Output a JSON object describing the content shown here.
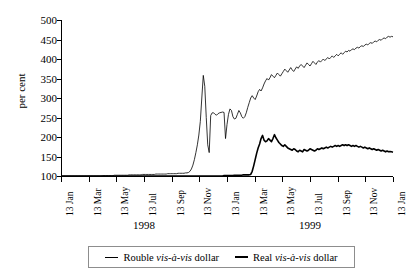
{
  "chart_data": {
    "type": "line",
    "title": "",
    "xlabel": "",
    "ylabel": "per cent",
    "ylim": [
      100,
      500
    ],
    "ytick_labels": [
      "500",
      "450",
      "400",
      "350",
      "300",
      "250",
      "200",
      "150",
      "100"
    ],
    "ytick_values": [
      500,
      450,
      400,
      350,
      300,
      250,
      200,
      150,
      100
    ],
    "grid": false,
    "legend_position": "bottom",
    "xtick_labels": [
      "13 Jan",
      "13 Mar",
      "13 May",
      "13 Jul",
      "13 Sep",
      "13 Nov",
      "13 Jan",
      "13 Mar",
      "13 May",
      "13 Jul",
      "13 Sep",
      "13 Nov",
      "13 Jan"
    ],
    "year_labels": [
      "1998",
      "1999"
    ],
    "series": [
      {
        "name": "Rouble vis-à-vis dollar",
        "style": "thin",
        "color": "#000000",
        "values": [
          100,
          100,
          100,
          100,
          100,
          100,
          100,
          100,
          100,
          100,
          100,
          100,
          100,
          100,
          100,
          100,
          100,
          100,
          100,
          100,
          100,
          100,
          100,
          100,
          100,
          100,
          100,
          100,
          101,
          101,
          101,
          101,
          101,
          101,
          101,
          101,
          102,
          102,
          102,
          102,
          102,
          102,
          102,
          102,
          102,
          102,
          103,
          103,
          103,
          103,
          103,
          103,
          103,
          103,
          103,
          104,
          104,
          104,
          104,
          104,
          104,
          104,
          104,
          104,
          105,
          105,
          105,
          105,
          105,
          105,
          105,
          105,
          106,
          106,
          106,
          106,
          106,
          106,
          106,
          107,
          107,
          107,
          107,
          107,
          108,
          108,
          109,
          112,
          118,
          128,
          142,
          160,
          180,
          205,
          240,
          300,
          358,
          330,
          250,
          180,
          160,
          255,
          262,
          262,
          258,
          256,
          260,
          262,
          263,
          264,
          263,
          196,
          232,
          258,
          272,
          268,
          252,
          246,
          248,
          258,
          268,
          262,
          252,
          248,
          252,
          262,
          276,
          288,
          300,
          306,
          300,
          296,
          305,
          316,
          322,
          318,
          326,
          336,
          344,
          350,
          346,
          352,
          360,
          356,
          352,
          358,
          364,
          360,
          356,
          362,
          368,
          374,
          370,
          366,
          372,
          378,
          372,
          368,
          374,
          380,
          376,
          382,
          386,
          382,
          378,
          384,
          390,
          386,
          382,
          388,
          394,
          390,
          386,
          392,
          396,
          392,
          396,
          400,
          396,
          400,
          404,
          400,
          404,
          408,
          404,
          408,
          412,
          408,
          412,
          416,
          412,
          416,
          420,
          418,
          422,
          420,
          424,
          426,
          424,
          428,
          430,
          428,
          432,
          434,
          432,
          436,
          438,
          436,
          440,
          442,
          440,
          444,
          446,
          444,
          448,
          450,
          448,
          452,
          454,
          452,
          456,
          458,
          456,
          458,
          457
        ]
      },
      {
        "name": "Real vis-à-vis dollar",
        "style": "thick",
        "color": "#000000",
        "values": [
          100,
          100,
          100,
          100,
          100,
          100,
          100,
          100,
          100,
          100,
          100,
          100,
          100,
          100,
          100,
          100,
          100,
          100,
          100,
          100,
          100,
          100,
          100,
          100,
          100,
          100,
          100,
          100,
          100,
          100,
          100,
          100,
          100,
          100,
          100,
          100,
          100,
          100,
          100,
          100,
          100,
          100,
          100,
          100,
          100,
          100,
          100,
          100,
          100,
          100,
          100,
          100,
          100,
          100,
          100,
          100,
          100,
          100,
          100,
          100,
          100,
          100,
          100,
          100,
          100,
          100,
          100,
          100,
          100,
          100,
          100,
          100,
          100,
          100,
          100,
          100,
          100,
          100,
          100,
          100,
          100,
          100,
          100,
          100,
          100,
          100,
          100,
          100,
          100,
          100,
          100,
          100,
          100,
          100,
          100,
          100,
          100,
          100,
          100,
          100,
          100,
          100,
          100,
          100,
          100,
          100,
          100,
          100,
          100,
          100,
          101,
          101,
          101,
          101,
          101,
          101,
          101,
          102,
          102,
          102,
          102,
          102,
          102,
          103,
          103,
          103,
          103,
          103,
          104,
          112,
          126,
          142,
          158,
          172,
          182,
          196,
          204,
          192,
          188,
          190,
          196,
          192,
          188,
          196,
          206,
          198,
          192,
          186,
          182,
          178,
          176,
          180,
          176,
          172,
          170,
          168,
          166,
          170,
          168,
          164,
          162,
          166,
          164,
          162,
          168,
          166,
          164,
          166,
          170,
          168,
          166,
          164,
          166,
          170,
          168,
          170,
          172,
          170,
          172,
          174,
          172,
          174,
          176,
          174,
          176,
          178,
          176,
          178,
          176,
          178,
          180,
          178,
          180,
          178,
          180,
          178,
          176,
          178,
          176,
          178,
          176,
          174,
          176,
          174,
          172,
          174,
          172,
          170,
          172,
          170,
          168,
          170,
          168,
          166,
          168,
          166,
          164,
          166,
          164,
          162,
          164,
          162,
          163,
          162,
          161
        ]
      }
    ]
  },
  "legend": {
    "entries": [
      {
        "prefix": "Rouble ",
        "italic": "vis-à-vis",
        "suffix": " dollar"
      },
      {
        "prefix": "Real ",
        "italic": "vis-à-vis",
        "suffix": " dollar"
      }
    ]
  }
}
